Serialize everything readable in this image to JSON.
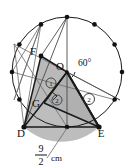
{
  "figure": {
    "type": "circle-geometry-diagram",
    "caption_unit": "cm",
    "measurement": {
      "numerator": "9",
      "denominator": "2",
      "unit": "cm",
      "full_text": "9/2 cm"
    },
    "angle": {
      "value": "60",
      "degree_symbol": "°",
      "label": "60°",
      "at_point": "O"
    },
    "points": [
      {
        "id": "F",
        "label": "F",
        "x": 41,
        "y": 56,
        "label_x": 33,
        "label_y": 55
      },
      {
        "id": "O",
        "label": "O",
        "x": 67,
        "y": 72,
        "label_x": 59,
        "label_y": 71
      },
      {
        "id": "G",
        "label": "G",
        "x": 44,
        "y": 103,
        "label_x": 36,
        "label_y": 106
      },
      {
        "id": "D",
        "label": "D",
        "x": 24,
        "y": 127,
        "label_x": 19,
        "label_y": 135
      },
      {
        "id": "E",
        "label": "E",
        "x": 99,
        "y": 127,
        "label_x": 98,
        "label_y": 136
      }
    ],
    "regions": [
      {
        "id": "region-1",
        "label": "1",
        "x": 51,
        "y": 83
      },
      {
        "id": "region-2-inner",
        "label": "2",
        "x": 57,
        "y": 100
      },
      {
        "id": "region-2-outer",
        "label": "2",
        "x": 89,
        "y": 99
      }
    ],
    "circle": {
      "center_x": 67,
      "center_y": 72,
      "radius": 55,
      "marked_point_count": 12,
      "stroke_color": "#1a1a1a"
    },
    "colors": {
      "shade_fill": "#b8b8b8",
      "shade_fill_light": "#c9c9c9",
      "stroke": "#1a1a1a",
      "thin_stroke": "#555555",
      "background": "#ffffff"
    }
  }
}
